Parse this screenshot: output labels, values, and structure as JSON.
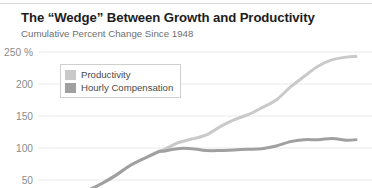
{
  "header": {
    "title": "The “Wedge” Between Growth and Productivity",
    "subtitle": "Cumulative Percent Change Since 1948"
  },
  "legend": {
    "position": "top-left-inside",
    "items": [
      {
        "label": "Productivity",
        "color": "#c9c9c9"
      },
      {
        "label": "Hourly Compensation",
        "color": "#a0a0a0"
      }
    ]
  },
  "axis": {
    "y_ticks": [
      "250 %",
      "200",
      "150",
      "100",
      "50"
    ],
    "y_tick_values": [
      250,
      200,
      150,
      100,
      50
    ]
  },
  "colors": {
    "title": "#1d1d1d",
    "subtitle": "#6f6f6f",
    "tick": "#8a8a8a",
    "gridline": "#eaeaea",
    "top_rule": "#d8d8d8",
    "productivity": "#c9c9c9",
    "compensation": "#a0a0a0",
    "background": "#ffffff"
  },
  "chart_data": {
    "type": "line",
    "title": "The “Wedge” Between Growth and Productivity",
    "subtitle": "Cumulative Percent Change Since 1948",
    "xlabel": "",
    "ylabel": "Cumulative Percent Change Since 1948",
    "ylim": [
      0,
      275
    ],
    "xlim": [
      1948,
      2014
    ],
    "grid": true,
    "yticks": [
      50,
      100,
      150,
      200,
      250
    ],
    "ytick_labels": [
      "50",
      "100",
      "150",
      "200",
      "250 %"
    ],
    "legend": [
      "Productivity",
      "Hourly Compensation"
    ],
    "x": [
      1948,
      1951,
      1954,
      1957,
      1960,
      1963,
      1966,
      1969,
      1972,
      1973,
      1976,
      1979,
      1982,
      1985,
      1988,
      1991,
      1994,
      1997,
      2000,
      2003,
      2006,
      2009,
      2012,
      2014
    ],
    "series": [
      {
        "name": "Productivity",
        "color": "#c9c9c9",
        "values": [
          0,
          13,
          24,
          34,
          45,
          58,
          73,
          84,
          95,
          97,
          108,
          114,
          120,
          133,
          144,
          152,
          163,
          175,
          195,
          212,
          228,
          238,
          242,
          243
        ]
      },
      {
        "name": "Hourly Compensation",
        "color": "#a0a0a0",
        "values": [
          0,
          13,
          24,
          34,
          45,
          58,
          73,
          84,
          94,
          95,
          99,
          99,
          96,
          96,
          97,
          98,
          99,
          103,
          110,
          113,
          113,
          115,
          112,
          113
        ]
      }
    ],
    "annotations": [
      "Lines track together from 1948 until the early 1970s, then diverge — the “wedge”.",
      "Productivity ends near 243% cumulative growth; hourly compensation near 113%."
    ]
  }
}
